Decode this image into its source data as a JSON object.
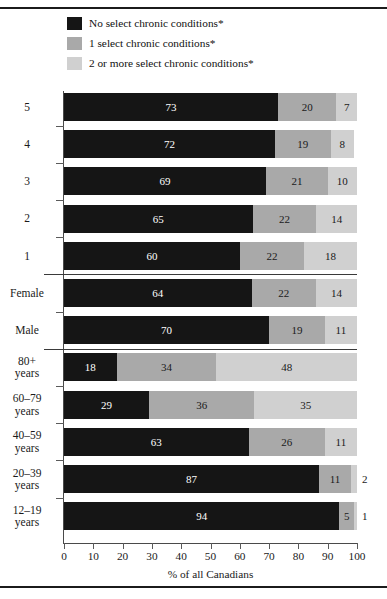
{
  "chart_data": {
    "type": "bar",
    "orientation": "horizontal",
    "stacked": true,
    "stack_total": 100,
    "title": "",
    "xlabel": "% of all Canadians",
    "ylabel": "(lowest) — Income quintile† — (highest)",
    "xlim": [
      0,
      100
    ],
    "xticks": [
      0,
      10,
      20,
      30,
      40,
      50,
      60,
      70,
      80,
      90,
      100
    ],
    "xtick_labels": [
      "0",
      "10",
      "20",
      "30",
      "40",
      "50",
      "60",
      "70",
      "80",
      "90",
      "100"
    ],
    "grid": false,
    "legend_position": "top",
    "legend": [
      {
        "label": "No select chronic conditions*",
        "color": "#151515",
        "key": "none"
      },
      {
        "label": "1 select chronic conditions*",
        "color": "#a9a9a9",
        "key": "one"
      },
      {
        "label": "2 or more select chronic conditions*",
        "color": "#d0d0d0",
        "key": "two_or_more"
      }
    ],
    "series": [
      {
        "name": "No select chronic conditions*",
        "color": "#151515",
        "values": [
          73,
          72,
          69,
          65,
          60,
          64,
          70,
          18,
          29,
          63,
          87,
          94
        ]
      },
      {
        "name": "1 select chronic conditions*",
        "color": "#a9a9a9",
        "values": [
          20,
          19,
          21,
          22,
          22,
          22,
          19,
          34,
          36,
          26,
          11,
          5
        ]
      },
      {
        "name": "2 or more select chronic conditions*",
        "color": "#d0d0d0",
        "values": [
          7,
          8,
          10,
          14,
          18,
          14,
          11,
          48,
          35,
          11,
          2,
          1
        ]
      }
    ],
    "categories": [
      "5",
      "4",
      "3",
      "2",
      "1",
      "Female",
      "Male",
      "80+\nyears",
      "60–79\nyears",
      "40–59\nyears",
      "20–39\nyears",
      "12–19\nyears"
    ],
    "groups": [
      {
        "name": "Income quintile",
        "start": 0,
        "count": 5
      },
      {
        "name": "Sex",
        "start": 5,
        "count": 2
      },
      {
        "name": "Age group",
        "start": 7,
        "count": 5
      }
    ],
    "rows": [
      {
        "category": "5",
        "none": 73,
        "one": 20,
        "two_or_more": 7
      },
      {
        "category": "4",
        "none": 72,
        "one": 19,
        "two_or_more": 8
      },
      {
        "category": "3",
        "none": 69,
        "one": 21,
        "two_or_more": 10
      },
      {
        "category": "2",
        "none": 65,
        "one": 22,
        "two_or_more": 14
      },
      {
        "category": "1",
        "none": 60,
        "one": 22,
        "two_or_more": 18
      },
      {
        "category": "Female",
        "none": 64,
        "one": 22,
        "two_or_more": 14
      },
      {
        "category": "Male",
        "none": 70,
        "one": 19,
        "two_or_more": 11
      },
      {
        "category": "80+\nyears",
        "none": 18,
        "one": 34,
        "two_or_more": 48
      },
      {
        "category": "60–79\nyears",
        "none": 29,
        "one": 36,
        "two_or_more": 35
      },
      {
        "category": "40–59\nyears",
        "none": 63,
        "one": 26,
        "two_or_more": 11
      },
      {
        "category": "20–39\nyears",
        "none": 87,
        "one": 11,
        "two_or_more": 2
      },
      {
        "category": "12–19\nyears",
        "none": 94,
        "one": 5,
        "two_or_more": 1
      }
    ]
  }
}
